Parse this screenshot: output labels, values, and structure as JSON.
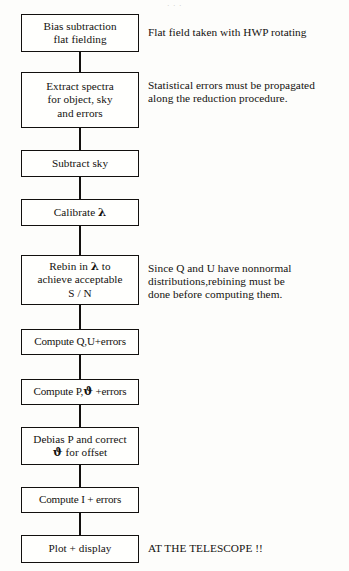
{
  "document": {
    "type": "flowchart",
    "title": "Spectropolarimetry data reduction flowchart",
    "top_cut_text": "· · ·"
  },
  "symbols": {
    "lambda": "λ",
    "vartheta": "ϑ"
  },
  "nodes": [
    {
      "id": "bias-subtraction",
      "lines": [
        "Bias subtraction",
        "flat fielding"
      ],
      "x": 21,
      "y": 14,
      "w": 118,
      "h": 38
    },
    {
      "id": "extract-spectra",
      "lines": [
        "Extract spectra",
        "for object, sky",
        "and errors"
      ],
      "x": 21,
      "y": 72,
      "w": 118,
      "h": 56
    },
    {
      "id": "subtract-sky",
      "lines": [
        "Subtract sky"
      ],
      "x": 21,
      "y": 150,
      "w": 118,
      "h": 27
    },
    {
      "id": "calibrate-lambda",
      "lines": [
        "Calibrate λ"
      ],
      "x": 21,
      "y": 199,
      "w": 118,
      "h": 27
    },
    {
      "id": "rebin-lambda",
      "lines": [
        "Rebin in λ to",
        "achieve acceptable",
        "S / N"
      ],
      "x": 21,
      "y": 255,
      "w": 118,
      "h": 50
    },
    {
      "id": "compute-qu-errors",
      "lines": [
        "Compute Q,U+errors"
      ],
      "x": 21,
      "y": 329,
      "w": 118,
      "h": 26
    },
    {
      "id": "compute-p-theta-errors",
      "lines": [
        "Compute P,ϑ +errors"
      ],
      "x": 21,
      "y": 379,
      "w": 118,
      "h": 26
    },
    {
      "id": "debias-p-correct-theta",
      "lines": [
        "Debias P and correct",
        "ϑ for offset"
      ],
      "x": 21,
      "y": 427,
      "w": 118,
      "h": 38
    },
    {
      "id": "compute-i-errors",
      "lines": [
        "Compute I + errors"
      ],
      "x": 21,
      "y": 487,
      "w": 118,
      "h": 26
    },
    {
      "id": "plot-display",
      "lines": [
        "Plot + display"
      ],
      "x": 21,
      "y": 535,
      "w": 118,
      "h": 28
    }
  ],
  "connectors": [
    {
      "id": "c1",
      "from": "bias-subtraction",
      "to": "extract-spectra",
      "y": 52,
      "h": 20
    },
    {
      "id": "c2",
      "from": "extract-spectra",
      "to": "subtract-sky",
      "y": 128,
      "h": 22
    },
    {
      "id": "c3",
      "from": "subtract-sky",
      "to": "calibrate-lambda",
      "y": 177,
      "h": 22
    },
    {
      "id": "c4",
      "from": "calibrate-lambda",
      "to": "rebin-lambda",
      "y": 226,
      "h": 29
    },
    {
      "id": "c5",
      "from": "rebin-lambda",
      "to": "compute-qu-errors",
      "y": 305,
      "h": 24
    },
    {
      "id": "c6",
      "from": "compute-qu-errors",
      "to": "compute-p-theta-errors",
      "y": 355,
      "h": 24
    },
    {
      "id": "c7",
      "from": "compute-p-theta-errors",
      "to": "debias-p-correct-theta",
      "y": 405,
      "h": 22
    },
    {
      "id": "c8",
      "from": "debias-p-correct-theta",
      "to": "compute-i-errors",
      "y": 465,
      "h": 22
    },
    {
      "id": "c9",
      "from": "compute-i-errors",
      "to": "plot-display",
      "y": 513,
      "h": 22
    }
  ],
  "annotations": [
    {
      "id": "note-flat-field",
      "for": "bias-subtraction",
      "lines": [
        "Flat field taken with HWP rotating"
      ],
      "x": 148,
      "y": 26
    },
    {
      "id": "note-statistical-errors",
      "for": "extract-spectra",
      "lines": [
        "Statistical errors must be propagated",
        "along the reduction procedure."
      ],
      "x": 148,
      "y": 79
    },
    {
      "id": "note-nonnormal-distributions",
      "for": "rebin-lambda",
      "lines": [
        "Since Q and U have nonnormal",
        "distributions,rebining must be",
        "done before computing them."
      ],
      "x": 148,
      "y": 262
    },
    {
      "id": "note-at-the-telescope",
      "for": "plot-display",
      "lines": [
        "AT THE TELESCOPE !!"
      ],
      "x": 148,
      "y": 542
    }
  ],
  "colors": {
    "ink": "#14120f",
    "paper": "#fdfdfb",
    "box_fill": "#fffffd"
  }
}
